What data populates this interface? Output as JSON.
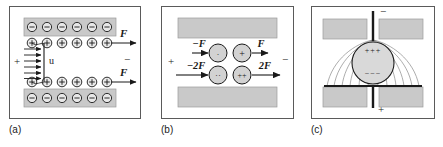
{
  "figure": {
    "panels": [
      {
        "id": "a",
        "caption": "(a)",
        "left_terminal": "+",
        "right_terminal": "−",
        "velocity_label": "u",
        "force_labels": [
          "F",
          "F"
        ],
        "plate_charge_symbol": "−",
        "inner_charge_symbol": "+",
        "plate_charge_count": 6,
        "inner_charge_count": 6
      },
      {
        "id": "b",
        "caption": "(b)",
        "left_terminal": "+",
        "right_terminal": "−",
        "charges": [
          {
            "sign": "-",
            "glyph": "·",
            "force_label": "−F",
            "direction": "left"
          },
          {
            "sign": "+",
            "glyph": "+",
            "force_label": "F",
            "direction": "right"
          },
          {
            "sign": "--",
            "glyph": "··",
            "force_label": "−2F",
            "direction": "left"
          },
          {
            "sign": "++",
            "glyph": "++",
            "force_label": "2F",
            "direction": "right"
          }
        ]
      },
      {
        "id": "c",
        "caption": "(c)",
        "top_terminal": "−",
        "bottom_terminal": "+",
        "sphere_top_charge": "+++",
        "sphere_bottom_charge": "−−−"
      }
    ]
  },
  "colors": {
    "plate_fill": "#c9c9c9",
    "plate_stroke": "#9a9a9a",
    "sphere_fill": "#d7d7d7",
    "line": "#1a1a1a",
    "frame": "#5a5a5a",
    "field_line": "#8a8a8a"
  }
}
